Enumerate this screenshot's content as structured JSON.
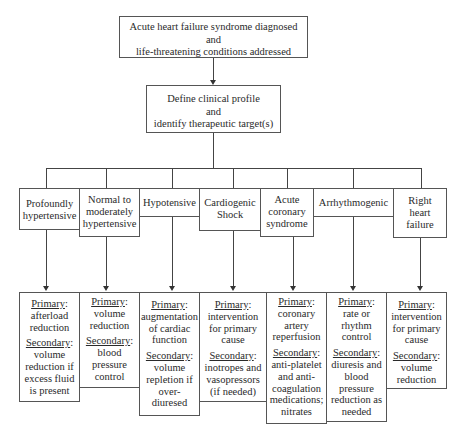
{
  "top": {
    "lines": [
      "Acute heart failure syndrome diagnosed",
      "and",
      "life-threatening conditions addressed"
    ]
  },
  "second": {
    "lines": [
      "Define clinical profile",
      "and",
      "identify therapeutic target(s)"
    ]
  },
  "profiles": [
    {
      "lines": [
        "Profoundly",
        "hypertensive"
      ]
    },
    {
      "lines": [
        "Normal to",
        "moderately",
        "hypertensive"
      ]
    },
    {
      "lines": [
        "Hypotensive"
      ]
    },
    {
      "lines": [
        "Cardiogenic",
        "Shock"
      ]
    },
    {
      "lines": [
        "Acute",
        "coronary",
        "syndrome"
      ]
    },
    {
      "lines": [
        "Arrhythmogenic"
      ]
    },
    {
      "lines": [
        "Right",
        "heart",
        "failure"
      ]
    }
  ],
  "labels": {
    "primary": "Primary",
    "secondary": "Secondary",
    "colon": ":"
  },
  "targets": [
    {
      "primary": [
        "afterload",
        "reduction"
      ],
      "secondary": [
        "volume",
        "reduction if",
        "excess fluid",
        "is present"
      ]
    },
    {
      "primary": [
        "volume",
        "reduction"
      ],
      "secondary": [
        "blood",
        "pressure",
        "control"
      ]
    },
    {
      "primary": [
        "augmentation",
        "of cardiac",
        "function"
      ],
      "secondary": [
        "volume",
        "repletion if",
        "over-",
        "diuresed"
      ]
    },
    {
      "primary": [
        "intervention",
        "for primary",
        "cause"
      ],
      "secondary": [
        "inotropes and",
        "vasopressors",
        "(if needed)"
      ]
    },
    {
      "primary": [
        "coronary",
        "artery",
        "reperfusion"
      ],
      "secondary": [
        "anti-platelet",
        "and anti-",
        "coagulation",
        "medications;",
        "nitrates"
      ]
    },
    {
      "primary": [
        "rate or",
        "rhythm",
        "control"
      ],
      "secondary": [
        "diuresis and",
        "blood",
        "pressure",
        "reduction as",
        "needed"
      ]
    },
    {
      "primary": [
        "intervention",
        "for primary",
        "cause"
      ],
      "secondary": [
        "volume",
        "reduction"
      ]
    }
  ]
}
